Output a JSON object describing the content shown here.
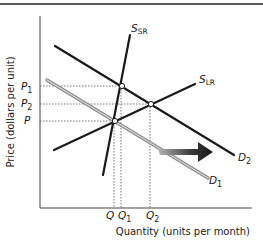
{
  "diagram": {
    "type": "supply-demand",
    "title": "",
    "y_axis_label": "Price (dollars per unit)",
    "x_axis_label": "Quantity (units per month)",
    "price_labels": [
      {
        "id": "P1",
        "main": "P",
        "sub": "1"
      },
      {
        "id": "P2",
        "main": "P",
        "sub": "2"
      },
      {
        "id": "P",
        "main": "P",
        "sub": ""
      }
    ],
    "quantity_labels": [
      {
        "id": "Q",
        "main": "Q",
        "sub": ""
      },
      {
        "id": "Q1",
        "main": "Q",
        "sub": "1"
      },
      {
        "id": "Q2",
        "main": "Q",
        "sub": "2"
      }
    ],
    "curves": [
      {
        "id": "S_SR",
        "main": "S",
        "sub": "SR",
        "kind": "short-run supply"
      },
      {
        "id": "S_LR",
        "main": "S",
        "sub": "LR",
        "kind": "long-run supply"
      },
      {
        "id": "D1",
        "main": "D",
        "sub": "1",
        "kind": "initial demand",
        "color": "#8a8a8a"
      },
      {
        "id": "D2",
        "main": "D",
        "sub": "2",
        "kind": "new demand",
        "color": "#1a1a1a"
      }
    ],
    "annotations": [
      {
        "id": "shift-arrow",
        "description": "Demand shift arrow pointing right"
      }
    ],
    "equilibria": [
      {
        "id": "initial",
        "price": "P",
        "quantity": "Q"
      },
      {
        "id": "short-run",
        "price": "P1",
        "quantity": "Q1"
      },
      {
        "id": "long-run",
        "price": "P2",
        "quantity": "Q2"
      }
    ]
  },
  "colors": {
    "line": "#1a1a1a",
    "d1_line": "#8a8a8a",
    "d1_inner": "#d0d0d0",
    "dotted": "#555555",
    "arrow_start": "#9a9a9a",
    "arrow_end": "#1a1a1a"
  }
}
